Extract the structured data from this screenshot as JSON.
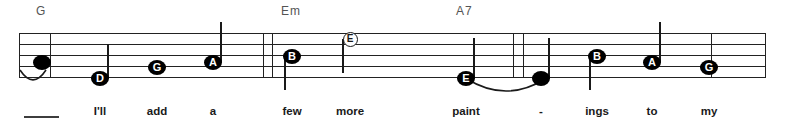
{
  "score": {
    "type": "music-notation-staff",
    "staff": {
      "left": 19,
      "right": 766,
      "line_top_y": 33,
      "line_spacing": 11,
      "line_count": 5
    },
    "chords": [
      {
        "name": "G",
        "x": 36,
        "label": "G"
      },
      {
        "name": "Em",
        "x": 281,
        "label": "Em"
      },
      {
        "name": "A7",
        "x": 456,
        "label": "A7"
      }
    ],
    "barlines": [
      {
        "x": 19,
        "y": 33,
        "height": 45
      },
      {
        "x": 50,
        "y": 33,
        "height": 45
      },
      {
        "x": 263,
        "y": 33,
        "height": 45
      },
      {
        "x": 272,
        "y": 33,
        "height": 45
      },
      {
        "x": 513,
        "y": 33,
        "height": 45
      },
      {
        "x": 523,
        "y": 33,
        "height": 45
      },
      {
        "x": 711,
        "y": 33,
        "height": 45
      },
      {
        "x": 765,
        "y": 33,
        "height": 45
      }
    ],
    "notes": [
      {
        "letter": "",
        "style": "plain",
        "x": 42,
        "y": 62,
        "stem": null,
        "lyric_index": 0
      },
      {
        "letter": "D",
        "style": "filled",
        "x": 100,
        "y": 78,
        "stem": {
          "dir": "up",
          "length": 34
        },
        "lyric_index": 1
      },
      {
        "letter": "G",
        "style": "filled",
        "x": 157,
        "y": 67,
        "stem": null,
        "lyric_index": 2
      },
      {
        "letter": "A",
        "style": "filled",
        "x": 213,
        "y": 62,
        "stem": {
          "dir": "up",
          "length": 40
        },
        "lyric_index": 3
      },
      {
        "letter": "B",
        "style": "filled",
        "x": 292,
        "y": 56,
        "stem": {
          "dir": "down",
          "length": 34
        },
        "lyric_index": 4
      },
      {
        "letter": "E",
        "style": "hollow",
        "x": 350,
        "y": 39,
        "stem": {
          "dir": "down",
          "length": 34
        },
        "lyric_index": 5
      },
      {
        "letter": "E",
        "style": "filled",
        "x": 466,
        "y": 78,
        "stem": {
          "dir": "up",
          "length": 40
        },
        "lyric_index": 6
      },
      {
        "letter": "",
        "style": "plain",
        "x": 541,
        "y": 78,
        "stem": {
          "dir": "up",
          "length": 40
        },
        "lyric_index": 7
      },
      {
        "letter": "B",
        "style": "filled",
        "x": 597,
        "y": 56,
        "stem": {
          "dir": "down",
          "length": 34
        },
        "lyric_index": 8
      },
      {
        "letter": "A",
        "style": "filled",
        "x": 652,
        "y": 62,
        "stem": {
          "dir": "up",
          "length": 40
        },
        "lyric_index": 9
      },
      {
        "letter": "G",
        "style": "filled",
        "x": 709,
        "y": 67,
        "stem": null,
        "lyric_index": 10
      }
    ],
    "ties": [
      {
        "name": "tie-pickup",
        "x": 19,
        "y": 68,
        "width": 28,
        "height": 15,
        "dir": "under"
      },
      {
        "name": "tie-paint-ings",
        "x": 466,
        "y": 77,
        "width": 80,
        "height": 18,
        "dir": "under"
      }
    ],
    "lyrics": [
      {
        "text": "",
        "x": 42,
        "extender": true
      },
      {
        "text": "I'll",
        "x": 100,
        "extender": false
      },
      {
        "text": "add",
        "x": 157,
        "extender": false
      },
      {
        "text": "a",
        "x": 213,
        "extender": false
      },
      {
        "text": "few",
        "x": 292,
        "extender": false
      },
      {
        "text": "more",
        "x": 350,
        "extender": false
      },
      {
        "text": "paint",
        "x": 466,
        "extender": false
      },
      {
        "text": "-",
        "x": 541,
        "extender": false
      },
      {
        "text": "ings",
        "x": 597,
        "extender": false
      },
      {
        "text": "to",
        "x": 652,
        "extender": false
      },
      {
        "text": "my",
        "x": 709,
        "extender": false
      }
    ],
    "lyric_extender": {
      "x": 24,
      "y": 116,
      "width": 35
    },
    "colors": {
      "ink": "#1a1a1a",
      "staff": "#222222",
      "chord_text": "#545454",
      "lyric_text": "#1a1a1a",
      "background": "#ffffff"
    }
  }
}
